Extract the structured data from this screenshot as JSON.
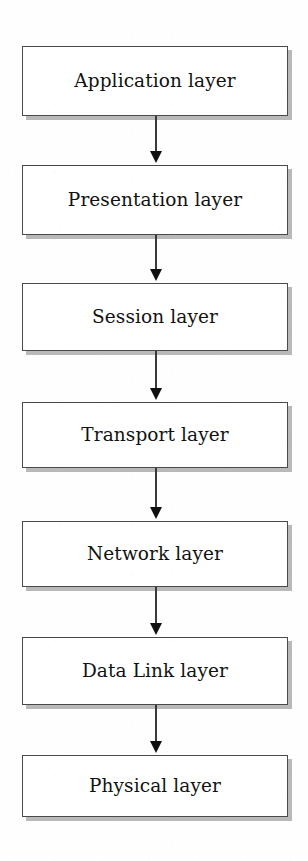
{
  "diagram": {
    "type": "flowchart-vertical-stack",
    "background_color": "#fefefe",
    "box": {
      "fill_color": "#ffffff",
      "border_color": "#4a4a4a",
      "shadow_color": "#b9b9b9",
      "text_color": "#121212",
      "left": 22,
      "width": 266
    },
    "connector": {
      "line_color": "#3a3a3a",
      "arrowhead_color": "#101010",
      "arrowhead_shape": "solid-triangle-down",
      "center_x": 156
    },
    "layers": [
      {
        "label": "Application layer",
        "index": 1,
        "top": 46,
        "height": 70,
        "connector_top": 116,
        "connector_height": 47,
        "has_connector": true
      },
      {
        "label": "Presentation layer",
        "index": 2,
        "top": 165,
        "height": 70,
        "connector_top": 235,
        "connector_height": 46,
        "has_connector": true
      },
      {
        "label": "Session layer",
        "index": 3,
        "top": 283,
        "height": 68,
        "connector_top": 351,
        "connector_height": 49,
        "has_connector": true
      },
      {
        "label": "Transport layer",
        "index": 4,
        "top": 402,
        "height": 66,
        "connector_top": 468,
        "connector_height": 51,
        "has_connector": true
      },
      {
        "label": "Network layer",
        "index": 5,
        "top": 521,
        "height": 66,
        "connector_top": 587,
        "connector_height": 48,
        "has_connector": true
      },
      {
        "label": "Data Link layer",
        "index": 6,
        "top": 637,
        "height": 68,
        "connector_top": 705,
        "connector_height": 48,
        "has_connector": true
      },
      {
        "label": "Physical layer",
        "index": 7,
        "top": 755,
        "height": 62,
        "connector_top": 0,
        "connector_height": 0,
        "has_connector": false
      }
    ]
  }
}
